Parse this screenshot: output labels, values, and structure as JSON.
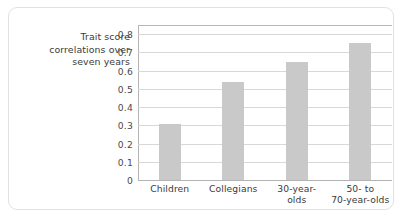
{
  "figure": {
    "background_color": "#ffffff",
    "card_border_color": "#e2e2e2"
  },
  "axis_title": {
    "line1": "Trait score",
    "line2": "correlations over",
    "line3": "seven years"
  },
  "chart_data": {
    "type": "bar",
    "title": "",
    "xlabel": "",
    "ylabel": "Trait score correlations over seven years",
    "categories": [
      "Children",
      "Collegians",
      "30-year-olds",
      "50- to 70-year-olds"
    ],
    "category_label_lines": [
      [
        "Children"
      ],
      [
        "Collegians"
      ],
      [
        "30-year-",
        "olds"
      ],
      [
        "50- to",
        "70-year-olds"
      ]
    ],
    "values": [
      0.31,
      0.54,
      0.645,
      0.75
    ],
    "ylim": [
      0,
      0.85
    ],
    "yticks": [
      0.8,
      0.7,
      0.6,
      0.5,
      0.4,
      0.3,
      0.2,
      0.1,
      0
    ],
    "ytick_labels": [
      "0.8",
      "0.7",
      "0.6",
      "0.5",
      "0.4",
      "0.3",
      "0.2",
      "0.1",
      "0"
    ],
    "grid": true,
    "grid_color": "#d8d8d8",
    "legend": null,
    "bar_color": "#c9c9c9",
    "axis_color": "#b4b4b4"
  }
}
